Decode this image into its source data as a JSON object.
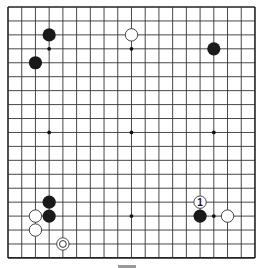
{
  "board": {
    "size": 19,
    "origin_x": 8,
    "origin_y": 7,
    "spacing_x": 13.72,
    "spacing_y": 13.94,
    "line_color": "#333333",
    "border_color": "#222222",
    "background": "#ffffff",
    "star_points": [
      [
        3,
        3
      ],
      [
        9,
        3
      ],
      [
        15,
        3
      ],
      [
        3,
        9
      ],
      [
        9,
        9
      ],
      [
        15,
        9
      ],
      [
        3,
        15
      ],
      [
        9,
        15
      ],
      [
        15,
        15
      ]
    ]
  },
  "stones": [
    {
      "color": "black",
      "col": 3,
      "row": 2
    },
    {
      "color": "black",
      "col": 2,
      "row": 4
    },
    {
      "color": "white",
      "col": 9,
      "row": 2
    },
    {
      "color": "black",
      "col": 15,
      "row": 3
    },
    {
      "color": "black",
      "col": 3,
      "row": 14
    },
    {
      "color": "black",
      "col": 3,
      "row": 15
    },
    {
      "color": "white",
      "col": 2,
      "row": 15
    },
    {
      "color": "white",
      "col": 2,
      "row": 16
    },
    {
      "color": "white",
      "col": 4,
      "row": 17,
      "marker": "circle"
    },
    {
      "color": "black",
      "col": 14,
      "row": 15
    },
    {
      "color": "white",
      "col": 14,
      "row": 14,
      "label": "1"
    },
    {
      "color": "white",
      "col": 16,
      "row": 15
    }
  ],
  "colors": {
    "black_stone": "#1a1a1a",
    "white_stone_fill": "#ffffff",
    "white_stone_stroke": "#333333"
  }
}
